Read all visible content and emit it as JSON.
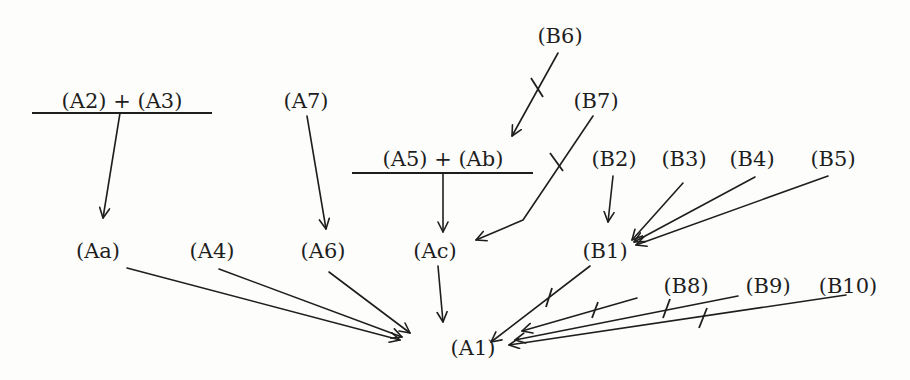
{
  "diagram": {
    "type": "directed-graph",
    "colors": {
      "ink": "#1e1e1e",
      "paper": "#fdfdfb"
    },
    "nodes": [
      {
        "id": "A2+A3",
        "label": "(A2) + (A3)",
        "x": 120,
        "y": 108,
        "combined": true,
        "bar": [
          32,
          212,
          113
        ]
      },
      {
        "id": "A7",
        "label": "(A7)",
        "x": 306,
        "y": 108
      },
      {
        "id": "B6",
        "label": "(B6)",
        "x": 560,
        "y": 43
      },
      {
        "id": "B7",
        "label": "(B7)",
        "x": 596,
        "y": 108
      },
      {
        "id": "A5+Ab",
        "label": "(A5) + (Ab)",
        "x": 443,
        "y": 166,
        "combined": true,
        "bar": [
          352,
          533,
          173
        ]
      },
      {
        "id": "B2",
        "label": "(B2)",
        "x": 614,
        "y": 166
      },
      {
        "id": "B3",
        "label": "(B3)",
        "x": 684,
        "y": 166
      },
      {
        "id": "B4",
        "label": "(B4)",
        "x": 752,
        "y": 166
      },
      {
        "id": "B5",
        "label": "(B5)",
        "x": 833,
        "y": 166
      },
      {
        "id": "Aa",
        "label": "(Aa)",
        "x": 98,
        "y": 258
      },
      {
        "id": "A4",
        "label": "(A4)",
        "x": 212,
        "y": 258
      },
      {
        "id": "A6",
        "label": "(A6)",
        "x": 323,
        "y": 258
      },
      {
        "id": "Ac",
        "label": "(Ac)",
        "x": 435,
        "y": 258
      },
      {
        "id": "B1",
        "label": "(B1)",
        "x": 605,
        "y": 258
      },
      {
        "id": "B8",
        "label": "(B8)",
        "x": 686,
        "y": 293
      },
      {
        "id": "B9",
        "label": "(B9)",
        "x": 768,
        "y": 293
      },
      {
        "id": "B10",
        "label": "(B10)",
        "x": 848,
        "y": 293
      },
      {
        "id": "A1",
        "label": "(A1)",
        "x": 473,
        "y": 355
      }
    ],
    "edges": [
      {
        "from": "A2+A3",
        "to": "Aa",
        "barred": false
      },
      {
        "from": "A7",
        "to": "A6",
        "barred": false
      },
      {
        "from": "B6",
        "to": "A5+Ab",
        "barred": true
      },
      {
        "from": "A5+Ab",
        "to": "Ac",
        "barred": false
      },
      {
        "from": "B7",
        "to": "Ac",
        "barred": true
      },
      {
        "from": "B2",
        "to": "B1",
        "barred": false
      },
      {
        "from": "B3",
        "to": "B1",
        "barred": false
      },
      {
        "from": "B4",
        "to": "B1",
        "barred": false
      },
      {
        "from": "B5",
        "to": "B1",
        "barred": false
      },
      {
        "from": "Aa",
        "to": "A1",
        "barred": false
      },
      {
        "from": "A4",
        "to": "A1",
        "barred": false
      },
      {
        "from": "A6",
        "to": "A1",
        "barred": false
      },
      {
        "from": "Ac",
        "to": "A1",
        "barred": false
      },
      {
        "from": "B1",
        "to": "A1",
        "barred": true
      },
      {
        "from": "B8",
        "to": "A1",
        "barred": true
      },
      {
        "from": "B9",
        "to": "A1",
        "barred": true
      },
      {
        "from": "B10",
        "to": "A1",
        "barred": true
      }
    ]
  },
  "labels": {
    "a2_a3": "(A2) + (A3)",
    "a7": "(A7)",
    "b6": "(B6)",
    "b7": "(B7)",
    "a5_ab": "(A5) + (Ab)",
    "b2": "(B2)",
    "b3": "(B3)",
    "b4": "(B4)",
    "b5": "(B5)",
    "aa": "(Aa)",
    "a4": "(A4)",
    "a6": "(A6)",
    "ac": "(Ac)",
    "b1": "(B1)",
    "b8": "(B8)",
    "b9": "(B9)",
    "b10": "(B10)",
    "a1": "(A1)"
  }
}
